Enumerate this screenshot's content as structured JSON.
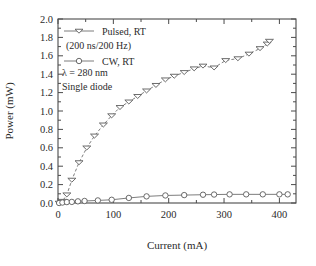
{
  "chart_data": {
    "type": "line",
    "title": "",
    "xlabel": "Current (mA)",
    "ylabel": "Power (mW)",
    "xlim": [
      0,
      430
    ],
    "ylim": [
      0.0,
      2.0
    ],
    "xticks": [
      0,
      100,
      200,
      300,
      400
    ],
    "xtick_labels": [
      "0",
      "100",
      "200",
      "300",
      "400"
    ],
    "yticks": [
      0.0,
      0.2,
      0.4,
      0.6,
      0.8,
      1.0,
      1.2,
      1.4,
      1.6,
      1.8,
      2.0
    ],
    "ytick_labels": [
      "0.0",
      "0.2",
      "0.4",
      "0.6",
      "0.8",
      "1.0",
      "1.2",
      "1.4",
      "1.6",
      "1.8",
      "2.0"
    ],
    "x_minor_ticks": [
      50,
      150,
      250,
      350
    ],
    "y_minor_ticks": [
      0.1,
      0.3,
      0.5,
      0.7,
      0.9,
      1.1,
      1.3,
      1.5,
      1.7,
      1.9
    ],
    "grid": false,
    "legend_position": "upper-left",
    "series": [
      {
        "name": "Pulsed, RT",
        "marker": "triangle-down",
        "linestyle": "dashed",
        "x": [
          2,
          8,
          16,
          25,
          38,
          52,
          66,
          82,
          97,
          112,
          128,
          144,
          160,
          177,
          194,
          210,
          228,
          246,
          262,
          282,
          303,
          325,
          345,
          365,
          378,
          382
        ],
        "y": [
          0.0,
          0.02,
          0.09,
          0.25,
          0.44,
          0.6,
          0.73,
          0.85,
          0.95,
          1.04,
          1.1,
          1.16,
          1.22,
          1.28,
          1.34,
          1.38,
          1.42,
          1.46,
          1.49,
          1.47,
          1.55,
          1.57,
          1.62,
          1.68,
          1.73,
          1.76
        ]
      },
      {
        "name": "CW, RT",
        "marker": "circle",
        "linestyle": "solid",
        "x": [
          2,
          8,
          16,
          25,
          36,
          48,
          72,
          97,
          128,
          160,
          194,
          228,
          262,
          282,
          310,
          340,
          370,
          400,
          415
        ],
        "y": [
          0.0,
          0.005,
          0.01,
          0.012,
          0.018,
          0.022,
          0.028,
          0.035,
          0.055,
          0.072,
          0.082,
          0.086,
          0.09,
          0.092,
          0.094,
          0.094,
          0.094,
          0.094,
          0.094
        ]
      }
    ],
    "legend_entries": [
      {
        "label": "Pulsed, RT",
        "marker": "triangle-down"
      },
      {
        "label": "CW, RT",
        "marker": "circle"
      }
    ],
    "annotations": [
      "(200 ns/200 Hz)",
      "λ = 280 nm",
      "Single diode"
    ]
  },
  "colors": {
    "frame": "#4a4a4a",
    "marker_edge": "#5a5a5a",
    "marker_face": "#ffffff",
    "line": "#6e6e6e",
    "text": "#2b2b2b",
    "background": "#ffffff"
  }
}
